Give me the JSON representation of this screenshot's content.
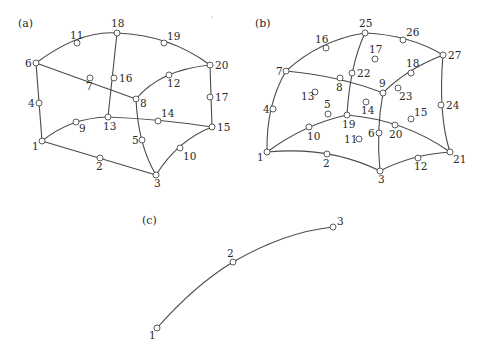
{
  "panels": [
    {
      "id": "a",
      "label": "(a)",
      "label_pos": [
        18,
        27
      ],
      "nodes": [
        {
          "n": "1",
          "x": 42,
          "y": 141,
          "lx": -10,
          "ly": 9
        },
        {
          "n": "2",
          "x": 100,
          "y": 158,
          "lx": -4,
          "ly": 12
        },
        {
          "n": "3",
          "x": 156,
          "y": 175,
          "lx": -2,
          "ly": 12
        },
        {
          "n": "4",
          "x": 39,
          "y": 103,
          "lx": -11,
          "ly": 4
        },
        {
          "n": "5",
          "x": 142,
          "y": 140,
          "lx": -10,
          "ly": 4
        },
        {
          "n": "6",
          "x": 36,
          "y": 63,
          "lx": -11,
          "ly": 4
        },
        {
          "n": "7",
          "x": 90,
          "y": 78,
          "lx": -4,
          "ly": 12
        },
        {
          "n": "8",
          "x": 136,
          "y": 99,
          "lx": 4,
          "ly": 8
        },
        {
          "n": "9",
          "x": 76,
          "y": 122,
          "lx": 3,
          "ly": 10
        },
        {
          "n": "10",
          "x": 180,
          "y": 148,
          "lx": 3,
          "ly": 12
        },
        {
          "n": "11",
          "x": 77,
          "y": 43,
          "lx": -7,
          "ly": -4
        },
        {
          "n": "12",
          "x": 169,
          "y": 75,
          "lx": -2,
          "ly": 12
        },
        {
          "n": "13",
          "x": 108,
          "y": 117,
          "lx": -5,
          "ly": 13
        },
        {
          "n": "14",
          "x": 158,
          "y": 121,
          "lx": 3,
          "ly": -4
        },
        {
          "n": "15",
          "x": 212,
          "y": 127,
          "lx": 5,
          "ly": 4
        },
        {
          "n": "16",
          "x": 114,
          "y": 78,
          "lx": 5,
          "ly": 4
        },
        {
          "n": "17",
          "x": 210,
          "y": 97,
          "lx": 5,
          "ly": 4
        },
        {
          "n": "18",
          "x": 117,
          "y": 33,
          "lx": -6,
          "ly": -6
        },
        {
          "n": "19",
          "x": 164,
          "y": 43,
          "lx": 3,
          "ly": -3
        },
        {
          "n": "20",
          "x": 210,
          "y": 65,
          "lx": 5,
          "ly": 4
        }
      ],
      "edges": [
        "M42,141 Q70,118 108,117",
        "M108,117 Q160,119 212,127",
        "M42,141 L156,175",
        "M156,175 Q178,140 212,127",
        "M36,63 L42,141",
        "M210,65 L212,127",
        "M36,63 Q80,30 117,33",
        "M117,33 Q170,35 210,65",
        "M36,63 L136,99",
        "M136,99 Q160,70 210,65",
        "M117,33 L108,117",
        "M136,99 Q138,145 156,175"
      ]
    },
    {
      "id": "b",
      "label": "(b)",
      "label_pos": [
        255,
        27
      ],
      "nodes": [
        {
          "n": "1",
          "x": 267,
          "y": 152,
          "lx": -10,
          "ly": 9
        },
        {
          "n": "2",
          "x": 327,
          "y": 154,
          "lx": -4,
          "ly": 13
        },
        {
          "n": "3",
          "x": 380,
          "y": 171,
          "lx": -2,
          "ly": 12
        },
        {
          "n": "4",
          "x": 273,
          "y": 109,
          "lx": -10,
          "ly": 4
        },
        {
          "n": "5",
          "x": 328,
          "y": 114,
          "lx": -4,
          "ly": -6
        },
        {
          "n": "6",
          "x": 379,
          "y": 133,
          "lx": -11,
          "ly": 4
        },
        {
          "n": "7",
          "x": 286,
          "y": 71,
          "lx": -10,
          "ly": 4
        },
        {
          "n": "8",
          "x": 340,
          "y": 78,
          "lx": -4,
          "ly": 13
        },
        {
          "n": "9",
          "x": 383,
          "y": 93,
          "lx": -4,
          "ly": -6
        },
        {
          "n": "10",
          "x": 309,
          "y": 127,
          "lx": -2,
          "ly": 13
        },
        {
          "n": "11",
          "x": 359,
          "y": 139,
          "lx": -15,
          "ly": 4
        },
        {
          "n": "12",
          "x": 418,
          "y": 158,
          "lx": -4,
          "ly": 12
        },
        {
          "n": "13",
          "x": 315,
          "y": 92,
          "lx": -14,
          "ly": 8
        },
        {
          "n": "14",
          "x": 366,
          "y": 102,
          "lx": -5,
          "ly": 12
        },
        {
          "n": "15",
          "x": 411,
          "y": 119,
          "lx": 3,
          "ly": -3
        },
        {
          "n": "16",
          "x": 326,
          "y": 48,
          "lx": -11,
          "ly": -5
        },
        {
          "n": "17",
          "x": 375,
          "y": 59,
          "lx": -6,
          "ly": -6
        },
        {
          "n": "18",
          "x": 411,
          "y": 73,
          "lx": -5,
          "ly": -6
        },
        {
          "n": "19",
          "x": 347,
          "y": 115,
          "lx": -5,
          "ly": 13
        },
        {
          "n": "20",
          "x": 395,
          "y": 125,
          "lx": -6,
          "ly": 13
        },
        {
          "n": "21",
          "x": 450,
          "y": 152,
          "lx": 3,
          "ly": 11
        },
        {
          "n": "22",
          "x": 352,
          "y": 73,
          "lx": 5,
          "ly": 4
        },
        {
          "n": "23",
          "x": 398,
          "y": 88,
          "lx": 1,
          "ly": 12
        },
        {
          "n": "24",
          "x": 441,
          "y": 105,
          "lx": 5,
          "ly": 4
        },
        {
          "n": "25",
          "x": 365,
          "y": 33,
          "lx": -6,
          "ly": -6
        },
        {
          "n": "26",
          "x": 403,
          "y": 40,
          "lx": 3,
          "ly": -4
        },
        {
          "n": "27",
          "x": 443,
          "y": 55,
          "lx": 5,
          "ly": 4
        }
      ],
      "edges": [
        "M267,152 Q305,124 347,115",
        "M347,115 Q405,120 450,152",
        "M267,152 Q330,146 380,171",
        "M380,171 Q410,155 450,152",
        "M286,71 Q266,105 267,152",
        "M443,55 Q438,115 450,152",
        "M286,71 Q320,40 365,33",
        "M365,33 Q410,35 443,55",
        "M286,71 Q340,76 383,93",
        "M383,93 Q405,70 443,55",
        "M365,33 Q350,65 347,115",
        "M383,93 Q376,130 380,171"
      ]
    },
    {
      "id": "c",
      "label": "(c)",
      "label_pos": [
        142,
        224
      ],
      "nodes": [
        {
          "n": "1",
          "x": 157,
          "y": 328,
          "lx": -8,
          "ly": 11
        },
        {
          "n": "2",
          "x": 233,
          "y": 262,
          "lx": -6,
          "ly": -5
        },
        {
          "n": "3",
          "x": 333,
          "y": 227,
          "lx": 4,
          "ly": -2
        }
      ],
      "edges": [
        "M157,328 Q195,285 233,262",
        "M233,262 Q285,232 333,227"
      ]
    }
  ]
}
